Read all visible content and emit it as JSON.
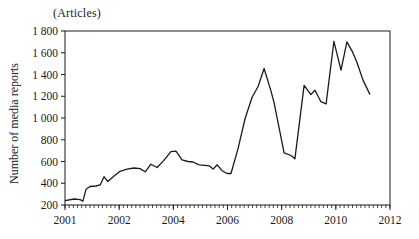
{
  "chart_data": {
    "type": "line",
    "title": "",
    "unit_label": "(Articles)",
    "ylabel": "Number of media reports",
    "xlabel": "",
    "grid": false,
    "legend": null,
    "line_color": "#1a1a1a",
    "frame": "full-box",
    "ylim": [
      200,
      1800
    ],
    "y_ticks": [
      200,
      400,
      600,
      800,
      1000,
      1200,
      1400,
      1600,
      1800
    ],
    "y_tick_labels": [
      "200",
      "400",
      "600",
      "800",
      "1 000",
      "1 200",
      "1 400",
      "1 600",
      "1 800"
    ],
    "x_tick_labels": [
      "2001",
      "2002",
      "2004",
      "2006",
      "2008",
      "2010",
      "2012"
    ],
    "x_tick_years": [
      2001,
      2002,
      2004,
      2006,
      2008,
      2010,
      2012
    ],
    "x_axis_note": "tick labels equally spaced: first interval covers 1 year (2001-2002), later intervals 2 years; small minor ticks along axis",
    "series": [
      {
        "name": "Number of media reports",
        "points": [
          [
            2001.0,
            240
          ],
          [
            2001.17,
            255
          ],
          [
            2001.28,
            250
          ],
          [
            2001.33,
            235
          ],
          [
            2001.39,
            345
          ],
          [
            2001.46,
            370
          ],
          [
            2001.57,
            375
          ],
          [
            2001.65,
            385
          ],
          [
            2001.72,
            460
          ],
          [
            2001.79,
            415
          ],
          [
            2001.9,
            465
          ],
          [
            2002.03,
            510
          ],
          [
            2002.29,
            530
          ],
          [
            2002.55,
            540
          ],
          [
            2002.77,
            535
          ],
          [
            2002.96,
            505
          ],
          [
            2003.17,
            575
          ],
          [
            2003.4,
            545
          ],
          [
            2003.65,
            610
          ],
          [
            2003.91,
            690
          ],
          [
            2004.1,
            695
          ],
          [
            2004.32,
            615
          ],
          [
            2004.54,
            600
          ],
          [
            2004.73,
            595
          ],
          [
            2004.95,
            570
          ],
          [
            2005.17,
            565
          ],
          [
            2005.32,
            560
          ],
          [
            2005.47,
            530
          ],
          [
            2005.62,
            570
          ],
          [
            2005.8,
            515
          ],
          [
            2005.99,
            490
          ],
          [
            2006.13,
            490
          ],
          [
            2006.39,
            720
          ],
          [
            2006.65,
            995
          ],
          [
            2006.91,
            1190
          ],
          [
            2007.13,
            1290
          ],
          [
            2007.35,
            1455
          ],
          [
            2007.61,
            1245
          ],
          [
            2007.72,
            1140
          ],
          [
            2008.09,
            680
          ],
          [
            2008.35,
            655
          ],
          [
            2008.49,
            625
          ],
          [
            2008.83,
            1300
          ],
          [
            2009.08,
            1215
          ],
          [
            2009.23,
            1255
          ],
          [
            2009.45,
            1150
          ],
          [
            2009.64,
            1130
          ],
          [
            2009.93,
            1705
          ],
          [
            2010.19,
            1440
          ],
          [
            2010.41,
            1700
          ],
          [
            2010.6,
            1615
          ],
          [
            2010.78,
            1510
          ],
          [
            2011.0,
            1350
          ],
          [
            2011.26,
            1215
          ]
        ]
      }
    ]
  }
}
